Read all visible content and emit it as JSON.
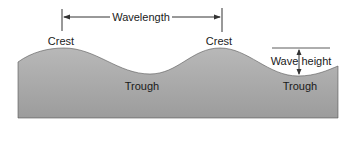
{
  "diagram": {
    "labels": {
      "wavelength": "Wavelength",
      "crest_left": "Crest",
      "crest_right": "Crest",
      "trough_left": "Trough",
      "trough_right": "Trough",
      "wave_height": "Wave height"
    },
    "colors": {
      "water_top": "#b4b4b4",
      "water_bottom": "#9a9a9a",
      "line": "#333333",
      "text": "#1a1a1a",
      "background": "#ffffff"
    }
  }
}
